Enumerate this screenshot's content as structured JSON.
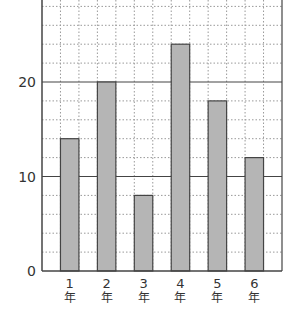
{
  "chart_data": {
    "type": "bar",
    "title": "",
    "xlabel": "",
    "ylabel": "",
    "categories": [
      {
        "num": "1",
        "unit": "年"
      },
      {
        "num": "2",
        "unit": "年"
      },
      {
        "num": "3",
        "unit": "年"
      },
      {
        "num": "4",
        "unit": "年"
      },
      {
        "num": "5",
        "unit": "年"
      },
      {
        "num": "6",
        "unit": "年"
      }
    ],
    "values": [
      14,
      20,
      8,
      24,
      18,
      12
    ],
    "ylim": [
      0,
      28.7
    ],
    "y_ticks": [
      0,
      10,
      20
    ],
    "y_tick_labels": [
      "0",
      "10",
      "20"
    ],
    "minor_grid_step": 2,
    "major_grid_step": 10,
    "grid": true,
    "bar_color": "#b5b5b5",
    "bar_edge_color": "#444444",
    "axis_color": "#444444",
    "grid_color": "#999999"
  }
}
